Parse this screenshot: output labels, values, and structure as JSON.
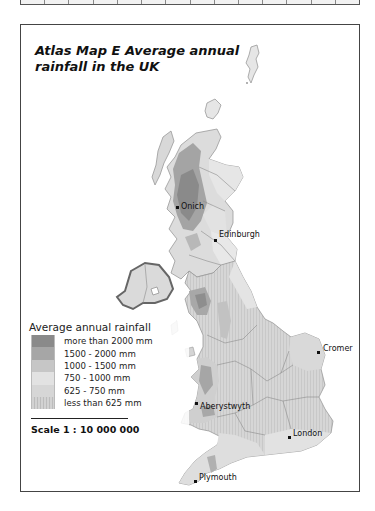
{
  "page": {
    "title": "Atlas Map E  Average annual rainfall in the UK"
  },
  "legend": {
    "title": "Average annual rainfall",
    "items": [
      {
        "label": "more than 2000 mm",
        "color": "#8a8a8a"
      },
      {
        "label": "1500 - 2000 mm",
        "color": "#a6a6a6"
      },
      {
        "label": "1000 - 1500 mm",
        "color": "#c6c6c6"
      },
      {
        "label": "750 - 1000 mm",
        "color": "#e2e2e2"
      },
      {
        "label": "625 - 750 mm",
        "color": "#d3d3d3"
      },
      {
        "label": "less than 625 mm",
        "color": "#c9c9c9"
      }
    ]
  },
  "scale": {
    "label": "Scale 1 : 10 000 000"
  },
  "cities": [
    {
      "name": "Onich",
      "x": 174,
      "y": 185
    },
    {
      "name": "Edinburgh",
      "x": 196,
      "y": 214
    },
    {
      "name": "Cromer",
      "x": 299,
      "y": 326
    },
    {
      "name": "Aberystwyth",
      "x": 175,
      "y": 380
    },
    {
      "name": "London",
      "x": 269,
      "y": 412
    },
    {
      "name": "Plymouth",
      "x": 194,
      "y": 458
    }
  ],
  "map_colors": {
    "land_light": "#e4e4e4",
    "land_mid": "#cfcfcf",
    "land_dark": "#a9a9a9",
    "land_darkest": "#8a8a8a",
    "region_border": "#8c8c8c",
    "ni_border": "#666666"
  }
}
